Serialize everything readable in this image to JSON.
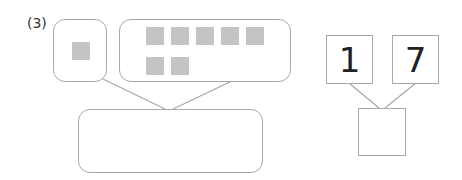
{
  "problem": {
    "label": "(3)",
    "left_group": {
      "small_set_count": 1,
      "large_set_count": 7,
      "answer": ""
    },
    "right_group": {
      "tens": "1",
      "ones": "7",
      "answer": ""
    }
  },
  "colors": {
    "border": "#a8a8a8",
    "square": "#c4c4c4"
  }
}
